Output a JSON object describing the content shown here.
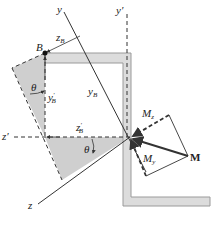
{
  "diagram": {
    "colors": {
      "section_fill": "#d9d9d9",
      "section_stroke": "#9a9a9a",
      "shaded_region": "#cfcfcf",
      "line": "#333333"
    },
    "labels": {
      "y_axis": "y",
      "y_prime_axis": "y",
      "y_prime_mark": "′",
      "z_axis": "z",
      "z_prime_axis": "z",
      "z_prime_mark": "′",
      "point_B": "B",
      "zB": "z",
      "zB_sub": "B",
      "yB": "y",
      "yB_sub": "B",
      "yB_prime": "y",
      "yB_prime_mark": "′",
      "yB_prime_sub": "B",
      "zB_prime": "z",
      "zB_prime_mark": "′",
      "zB_prime_sub": "B",
      "theta_top": "θ",
      "theta_bottom": "θ",
      "Mz": "M",
      "Mz_sub": "z",
      "My": "M",
      "My_sub": "y",
      "M": "M"
    }
  }
}
